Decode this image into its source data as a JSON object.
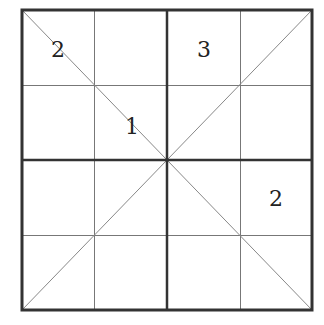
{
  "puzzle": {
    "type": "4x4 diagonal sudoku",
    "size": 4,
    "box_size": 2,
    "grid": {
      "left": 22,
      "top": 10,
      "right": 312,
      "bottom": 310,
      "thick_color": "#333333",
      "thin_color": "#777777",
      "diagonal_color": "#888888"
    },
    "givens": [
      {
        "row": 0,
        "col": 0,
        "value": "2",
        "x": 58,
        "y": 57
      },
      {
        "row": 0,
        "col": 2,
        "value": "3",
        "x": 204,
        "y": 57
      },
      {
        "row": 1,
        "col": 1,
        "value": "1",
        "x": 132,
        "y": 134
      },
      {
        "row": 2,
        "col": 3,
        "value": "2",
        "x": 276,
        "y": 206
      }
    ],
    "cells": [
      [
        "2",
        "",
        "3",
        ""
      ],
      [
        "",
        "1",
        "",
        ""
      ],
      [
        "",
        "",
        "",
        "2"
      ],
      [
        "",
        "",
        "",
        ""
      ]
    ]
  }
}
